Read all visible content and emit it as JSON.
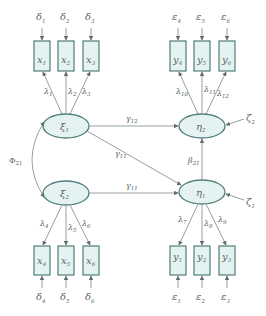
{
  "diagram": {
    "type": "structural-equation-model",
    "colors": {
      "node_fill": "#e4f3f1",
      "node_stroke": "#4f7f7a",
      "edge": "#8a9694",
      "text": "#5a6664"
    },
    "exogenous_latent": [
      {
        "id": "xi1",
        "symbol": "ξ",
        "sub": "1"
      },
      {
        "id": "xi2",
        "symbol": "ξ",
        "sub": "2"
      }
    ],
    "endogenous_latent": [
      {
        "id": "eta1",
        "symbol": "η",
        "sub": "1"
      },
      {
        "id": "eta2",
        "symbol": "η",
        "sub": "2"
      }
    ],
    "x_indicators": [
      {
        "id": "x1",
        "symbol": "x",
        "sub": "1",
        "error": {
          "symbol": "δ",
          "sub": "1"
        },
        "loading": {
          "symbol": "λ",
          "sub": "1"
        }
      },
      {
        "id": "x2",
        "symbol": "x",
        "sub": "2",
        "error": {
          "symbol": "δ",
          "sub": "2"
        },
        "loading": {
          "symbol": "λ",
          "sub": "2"
        }
      },
      {
        "id": "x3",
        "symbol": "x",
        "sub": "3",
        "error": {
          "symbol": "δ",
          "sub": "3"
        },
        "loading": {
          "symbol": "λ",
          "sub": "3"
        }
      },
      {
        "id": "x4",
        "symbol": "x",
        "sub": "4",
        "error": {
          "symbol": "δ",
          "sub": "4"
        },
        "loading": {
          "symbol": "λ",
          "sub": "4"
        }
      },
      {
        "id": "x5",
        "symbol": "x",
        "sub": "5",
        "error": {
          "symbol": "δ",
          "sub": "5"
        },
        "loading": {
          "symbol": "λ",
          "sub": "5"
        }
      },
      {
        "id": "x6",
        "symbol": "x",
        "sub": "6",
        "error": {
          "symbol": "δ",
          "sub": "6"
        },
        "loading": {
          "symbol": "λ",
          "sub": "6"
        }
      }
    ],
    "y_indicators": [
      {
        "id": "y1",
        "symbol": "y",
        "sub": "1",
        "error": {
          "symbol": "ε",
          "sub": "1"
        },
        "loading": {
          "symbol": "λ",
          "sub": "7"
        }
      },
      {
        "id": "y2",
        "symbol": "y",
        "sub": "2",
        "error": {
          "symbol": "ε",
          "sub": "2"
        },
        "loading": {
          "symbol": "λ",
          "sub": "8"
        }
      },
      {
        "id": "y3",
        "symbol": "y",
        "sub": "3",
        "error": {
          "symbol": "ε",
          "sub": "3"
        },
        "loading": {
          "symbol": "λ",
          "sub": "9"
        }
      },
      {
        "id": "y4",
        "symbol": "y",
        "sub": "4",
        "error": {
          "symbol": "ε",
          "sub": "4"
        },
        "loading": {
          "symbol": "λ",
          "sub": "10"
        }
      },
      {
        "id": "y5",
        "symbol": "y",
        "sub": "5",
        "error": {
          "symbol": "ε",
          "sub": "5"
        },
        "loading": {
          "symbol": "λ",
          "sub": "11"
        }
      },
      {
        "id": "y6",
        "symbol": "y",
        "sub": "6",
        "error": {
          "symbol": "ε",
          "sub": "6"
        },
        "loading": {
          "symbol": "λ",
          "sub": "12"
        }
      }
    ],
    "disturbances": [
      {
        "target": "eta2",
        "symbol": "ζ",
        "sub": "2"
      },
      {
        "target": "eta1",
        "symbol": "ζ",
        "sub": "1"
      }
    ],
    "structural_paths": [
      {
        "from": "xi1",
        "to": "eta2",
        "symbol": "γ",
        "sub": "12"
      },
      {
        "from": "xi1",
        "to": "eta1",
        "symbol": "γ",
        "sub": "11"
      },
      {
        "from": "xi2",
        "to": "eta1",
        "symbol": "γ",
        "sub": "11"
      },
      {
        "from": "eta1",
        "to": "eta2",
        "symbol": "β",
        "sub": "21"
      }
    ],
    "covariance": {
      "between": [
        "xi1",
        "xi2"
      ],
      "symbol": "Φ",
      "sub": "21"
    }
  }
}
